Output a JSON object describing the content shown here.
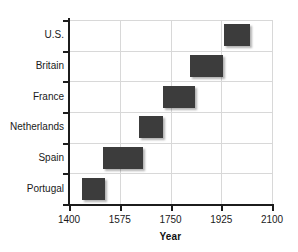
{
  "chart_data": {
    "type": "bar",
    "orientation": "horizontal",
    "title": "",
    "xlabel": "Year",
    "ylabel": "",
    "xlim": [
      1400,
      2100
    ],
    "ylim": [
      0,
      6
    ],
    "grid": true,
    "legend": null,
    "bar_color": "#3c3c3c",
    "grid_color": "#d8d8d8",
    "axis_color": "#1c1c1c",
    "xticks": [
      1400,
      1575,
      1750,
      1925,
      2100
    ],
    "xticklabels": [
      "1400",
      "1575",
      "1750",
      "1925",
      "2100"
    ],
    "categories": [
      "Portugal",
      "Spain",
      "Netherlands",
      "France",
      "Britain",
      "U.S."
    ],
    "bars": [
      {
        "category": "Portugal",
        "start": 1445,
        "end": 1524
      },
      {
        "category": "Spain",
        "start": 1517,
        "end": 1655
      },
      {
        "category": "Netherlands",
        "start": 1641,
        "end": 1724
      },
      {
        "category": "France",
        "start": 1724,
        "end": 1834
      },
      {
        "category": "Britain",
        "start": 1817,
        "end": 1931
      },
      {
        "category": "U.S.",
        "start": 1934,
        "end": 2024
      }
    ]
  }
}
